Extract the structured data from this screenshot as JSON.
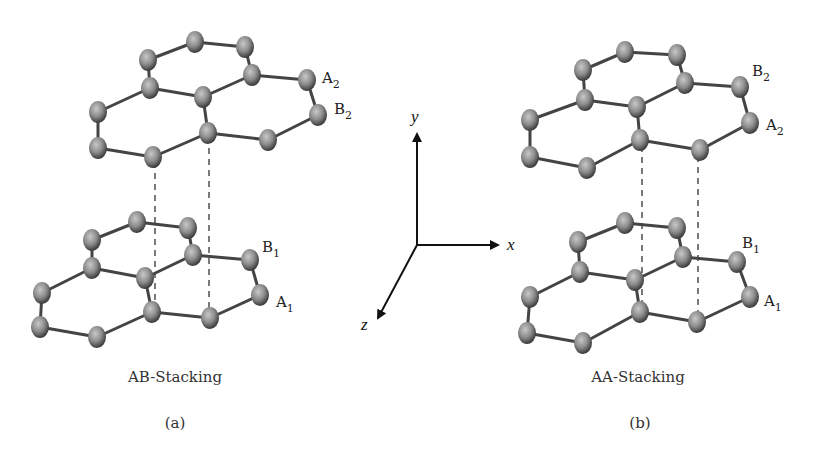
{
  "figure": {
    "panels": [
      {
        "id": "a",
        "caption": "AB-Stacking",
        "panel_label": "(a)",
        "top_layer_labels": {
          "first": "A",
          "first_sub": "2",
          "second": "B",
          "second_sub": "2"
        },
        "bottom_layer_labels": {
          "first": "B",
          "first_sub": "1",
          "second": "A",
          "second_sub": "1"
        }
      },
      {
        "id": "b",
        "caption": "AA-Stacking",
        "panel_label": "(b)",
        "top_layer_labels": {
          "first": "B",
          "first_sub": "2",
          "second": "A",
          "second_sub": "2"
        },
        "bottom_layer_labels": {
          "first": "B",
          "first_sub": "1",
          "second": "A",
          "second_sub": "1"
        }
      }
    ],
    "axes": {
      "x": "x",
      "y": "y",
      "z": "z"
    },
    "colors": {
      "atom": "#8c8c8c",
      "atom_highlight": "#c8c8c8",
      "bond": "#444444",
      "background": "#ffffff"
    }
  }
}
